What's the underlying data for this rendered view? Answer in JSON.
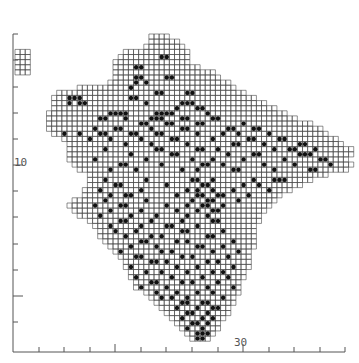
{
  "map": {
    "type": "grid distribution map (10km squares with occurrence dots)",
    "colors": {
      "grid": "#444444",
      "dot": "#111111",
      "axis": "#555555",
      "background": "#ffffff"
    },
    "cell_px": 5.12,
    "origin": {
      "x": 13,
      "y": 34
    },
    "axis": {
      "x_label_30": "30",
      "y_label_10": "10",
      "x_ticks_px": [
        39,
        64,
        90,
        115,
        141,
        166,
        192,
        218,
        243,
        269,
        294,
        320,
        345
      ],
      "x_long_ticks_px": [
        115,
        243
      ],
      "y_ticks_px": [
        34,
        60,
        87,
        113,
        139,
        165,
        191,
        217,
        244,
        270,
        296,
        322
      ],
      "y_long_ticks_px": [
        165,
        296
      ],
      "baseline_y": 352,
      "left_x": 13
    },
    "rows": [
      [
        24,
        27
      ],
      [
        24,
        29
      ],
      [
        23,
        30
      ],
      [
        19,
        31
      ],
      [
        18,
        31
      ],
      [
        17,
        31
      ],
      [
        17,
        33
      ],
      [
        17,
        36
      ],
      [
        17,
        37
      ],
      [
        16,
        39
      ],
      [
        10,
        40
      ],
      [
        6,
        42
      ],
      [
        5,
        44
      ],
      [
        5,
        46
      ],
      [
        5,
        48
      ],
      [
        4,
        50
      ],
      [
        4,
        52
      ],
      [
        4,
        55
      ],
      [
        4,
        57
      ],
      [
        5,
        58
      ],
      [
        7,
        60
      ],
      [
        8,
        61
      ],
      [
        8,
        63
      ],
      [
        8,
        63
      ],
      [
        8,
        62
      ],
      [
        9,
        63
      ],
      [
        10,
        62
      ],
      [
        12,
        58
      ],
      [
        12,
        55
      ],
      [
        12,
        53
      ],
      [
        11,
        51
      ],
      [
        11,
        49
      ],
      [
        9,
        48
      ],
      [
        8,
        47
      ],
      [
        9,
        46
      ],
      [
        10,
        45
      ],
      [
        12,
        45
      ],
      [
        13,
        44
      ],
      [
        14,
        44
      ],
      [
        14,
        44
      ],
      [
        15,
        44
      ],
      [
        16,
        44
      ],
      [
        17,
        43
      ],
      [
        18,
        43
      ],
      [
        19,
        43
      ],
      [
        19,
        43
      ],
      [
        20,
        42
      ],
      [
        20,
        42
      ],
      [
        21,
        41
      ],
      [
        21,
        41
      ],
      [
        23,
        41
      ],
      [
        24,
        40
      ],
      [
        25,
        40
      ],
      [
        26,
        39
      ],
      [
        27,
        39
      ],
      [
        28,
        38
      ],
      [
        29,
        37
      ],
      [
        30,
        37
      ],
      [
        31,
        36
      ],
      [
        32,
        35
      ]
    ],
    "inset": {
      "col": 0,
      "row": 3,
      "w": 3,
      "h": 5
    },
    "dots": [
      [
        26,
        4
      ],
      [
        27,
        4
      ],
      [
        21,
        6
      ],
      [
        22,
        6
      ],
      [
        21,
        8
      ],
      [
        22,
        8
      ],
      [
        27,
        8
      ],
      [
        28,
        8
      ],
      [
        21,
        9
      ],
      [
        23,
        9
      ],
      [
        20,
        10
      ],
      [
        25,
        11
      ],
      [
        26,
        11
      ],
      [
        31,
        11
      ],
      [
        32,
        11
      ],
      [
        20,
        12
      ],
      [
        21,
        12
      ],
      [
        23,
        13
      ],
      [
        30,
        13
      ],
      [
        31,
        13
      ],
      [
        32,
        13
      ],
      [
        29,
        14
      ],
      [
        33,
        14
      ],
      [
        34,
        14
      ],
      [
        16,
        15
      ],
      [
        17,
        15
      ],
      [
        18,
        15
      ],
      [
        19,
        15
      ],
      [
        25,
        15
      ],
      [
        26,
        15
      ],
      [
        27,
        15
      ],
      [
        28,
        15
      ],
      [
        35,
        15
      ],
      [
        8,
        12
      ],
      [
        9,
        12
      ],
      [
        10,
        12
      ],
      [
        8,
        13
      ],
      [
        10,
        13
      ],
      [
        11,
        13
      ],
      [
        14,
        16
      ],
      [
        15,
        16
      ],
      [
        19,
        16
      ],
      [
        24,
        16
      ],
      [
        25,
        16
      ],
      [
        26,
        16
      ],
      [
        30,
        16
      ],
      [
        31,
        16
      ],
      [
        36,
        16
      ],
      [
        37,
        16
      ],
      [
        22,
        17
      ],
      [
        23,
        17
      ],
      [
        27,
        17
      ],
      [
        28,
        17
      ],
      [
        33,
        17
      ],
      [
        34,
        17
      ],
      [
        42,
        17
      ],
      [
        13,
        18
      ],
      [
        17,
        18
      ],
      [
        18,
        18
      ],
      [
        24,
        18
      ],
      [
        30,
        18
      ],
      [
        31,
        18
      ],
      [
        39,
        18
      ],
      [
        40,
        18
      ],
      [
        44,
        18
      ],
      [
        45,
        18
      ],
      [
        7,
        19
      ],
      [
        10,
        19
      ],
      [
        14,
        19
      ],
      [
        15,
        19
      ],
      [
        20,
        19
      ],
      [
        21,
        19
      ],
      [
        25,
        19
      ],
      [
        26,
        19
      ],
      [
        33,
        19
      ],
      [
        38,
        19
      ],
      [
        41,
        19
      ],
      [
        47,
        19
      ],
      [
        12,
        20
      ],
      [
        16,
        20
      ],
      [
        22,
        20
      ],
      [
        28,
        20
      ],
      [
        29,
        20
      ],
      [
        36,
        20
      ],
      [
        43,
        20
      ],
      [
        44,
        20
      ],
      [
        49,
        20
      ],
      [
        50,
        20
      ],
      [
        19,
        21
      ],
      [
        24,
        21
      ],
      [
        31,
        21
      ],
      [
        40,
        21
      ],
      [
        41,
        21
      ],
      [
        46,
        21
      ],
      [
        53,
        21
      ],
      [
        54,
        21
      ],
      [
        15,
        22
      ],
      [
        25,
        22
      ],
      [
        26,
        22
      ],
      [
        33,
        22
      ],
      [
        34,
        22
      ],
      [
        37,
        22
      ],
      [
        48,
        22
      ],
      [
        51,
        22
      ],
      [
        52,
        22
      ],
      [
        56,
        22
      ],
      [
        20,
        23
      ],
      [
        28,
        23
      ],
      [
        29,
        23
      ],
      [
        39,
        23
      ],
      [
        44,
        23
      ],
      [
        45,
        23
      ],
      [
        53,
        23
      ],
      [
        54,
        23
      ],
      [
        55,
        23
      ],
      [
        13,
        24
      ],
      [
        23,
        24
      ],
      [
        32,
        24
      ],
      [
        36,
        24
      ],
      [
        42,
        24
      ],
      [
        50,
        24
      ],
      [
        57,
        24
      ],
      [
        58,
        24
      ],
      [
        18,
        25
      ],
      [
        19,
        25
      ],
      [
        26,
        25
      ],
      [
        34,
        25
      ],
      [
        35,
        25
      ],
      [
        38,
        25
      ],
      [
        46,
        25
      ],
      [
        52,
        25
      ],
      [
        59,
        25
      ],
      [
        16,
        26
      ],
      [
        21,
        26
      ],
      [
        30,
        26
      ],
      [
        33,
        26
      ],
      [
        40,
        26
      ],
      [
        41,
        26
      ],
      [
        48,
        26
      ],
      [
        55,
        26
      ],
      [
        56,
        26
      ],
      [
        15,
        28
      ],
      [
        23,
        28
      ],
      [
        32,
        28
      ],
      [
        33,
        28
      ],
      [
        36,
        28
      ],
      [
        44,
        28
      ],
      [
        48,
        28
      ],
      [
        49,
        28
      ],
      [
        50,
        28
      ],
      [
        17,
        29
      ],
      [
        18,
        29
      ],
      [
        27,
        29
      ],
      [
        34,
        29
      ],
      [
        35,
        29
      ],
      [
        42,
        29
      ],
      [
        45,
        29
      ],
      [
        14,
        30
      ],
      [
        22,
        30
      ],
      [
        31,
        30
      ],
      [
        33,
        30
      ],
      [
        36,
        30
      ],
      [
        40,
        30
      ],
      [
        47,
        30
      ],
      [
        16,
        31
      ],
      [
        19,
        31
      ],
      [
        20,
        31
      ],
      [
        29,
        31
      ],
      [
        33,
        31
      ],
      [
        34,
        31
      ],
      [
        37,
        31
      ],
      [
        38,
        31
      ],
      [
        43,
        31
      ],
      [
        15,
        32
      ],
      [
        23,
        32
      ],
      [
        32,
        32
      ],
      [
        35,
        32
      ],
      [
        36,
        32
      ],
      [
        41,
        32
      ],
      [
        13,
        33
      ],
      [
        18,
        33
      ],
      [
        19,
        33
      ],
      [
        27,
        33
      ],
      [
        31,
        33
      ],
      [
        34,
        33
      ],
      [
        35,
        33
      ],
      [
        38,
        33
      ],
      [
        16,
        34
      ],
      [
        22,
        34
      ],
      [
        29,
        34
      ],
      [
        33,
        34
      ],
      [
        36,
        34
      ],
      [
        37,
        34
      ],
      [
        14,
        35
      ],
      [
        20,
        35
      ],
      [
        25,
        35
      ],
      [
        31,
        35
      ],
      [
        35,
        35
      ],
      [
        18,
        36
      ],
      [
        19,
        36
      ],
      [
        24,
        36
      ],
      [
        30,
        36
      ],
      [
        36,
        36
      ],
      [
        37,
        36
      ],
      [
        16,
        37
      ],
      [
        22,
        37
      ],
      [
        27,
        37
      ],
      [
        28,
        37
      ],
      [
        33,
        37
      ],
      [
        17,
        38
      ],
      [
        21,
        38
      ],
      [
        30,
        38
      ],
      [
        31,
        38
      ],
      [
        38,
        38
      ],
      [
        19,
        39
      ],
      [
        24,
        39
      ],
      [
        26,
        39
      ],
      [
        35,
        39
      ],
      [
        36,
        39
      ],
      [
        22,
        40
      ],
      [
        23,
        40
      ],
      [
        29,
        40
      ],
      [
        31,
        40
      ],
      [
        40,
        40
      ],
      [
        20,
        41
      ],
      [
        25,
        41
      ],
      [
        33,
        41
      ],
      [
        34,
        41
      ],
      [
        38,
        41
      ],
      [
        18,
        42
      ],
      [
        26,
        42
      ],
      [
        28,
        42
      ],
      [
        36,
        42
      ],
      [
        41,
        42
      ],
      [
        21,
        43
      ],
      [
        22,
        43
      ],
      [
        30,
        43
      ],
      [
        32,
        43
      ],
      [
        39,
        43
      ],
      [
        24,
        44
      ],
      [
        25,
        44
      ],
      [
        27,
        44
      ],
      [
        35,
        44
      ],
      [
        37,
        44
      ],
      [
        20,
        45
      ],
      [
        29,
        45
      ],
      [
        33,
        45
      ],
      [
        40,
        45
      ],
      [
        23,
        46
      ],
      [
        26,
        46
      ],
      [
        31,
        46
      ],
      [
        36,
        46
      ],
      [
        38,
        46
      ],
      [
        21,
        47
      ],
      [
        28,
        47
      ],
      [
        34,
        47
      ],
      [
        39,
        47
      ],
      [
        24,
        48
      ],
      [
        25,
        48
      ],
      [
        30,
        48
      ],
      [
        32,
        48
      ],
      [
        37,
        48
      ],
      [
        22,
        49
      ],
      [
        27,
        49
      ],
      [
        35,
        49
      ],
      [
        40,
        49
      ],
      [
        25,
        50
      ],
      [
        29,
        50
      ],
      [
        33,
        50
      ],
      [
        36,
        50
      ],
      [
        26,
        51
      ],
      [
        28,
        51
      ],
      [
        31,
        51
      ],
      [
        38,
        51
      ],
      [
        30,
        52
      ],
      [
        31,
        52
      ],
      [
        34,
        52
      ],
      [
        35,
        52
      ],
      [
        29,
        53
      ],
      [
        33,
        53
      ],
      [
        36,
        53
      ],
      [
        37,
        53
      ],
      [
        31,
        54
      ],
      [
        32,
        54
      ],
      [
        35,
        54
      ],
      [
        30,
        55
      ],
      [
        34,
        55
      ],
      [
        36,
        55
      ],
      [
        32,
        56
      ],
      [
        33,
        56
      ],
      [
        35,
        56
      ],
      [
        31,
        57
      ],
      [
        34,
        57
      ],
      [
        33,
        58
      ],
      [
        34,
        58
      ],
      [
        35,
        58
      ],
      [
        33,
        59
      ],
      [
        34,
        59
      ]
    ]
  }
}
